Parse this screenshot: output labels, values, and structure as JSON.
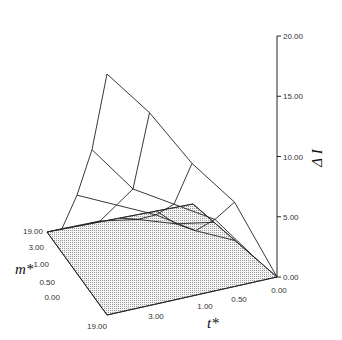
{
  "chart_data": {
    "type": "surface3d",
    "title": "",
    "zlabel": "Δ I",
    "xlabel": "t*",
    "ylabel": "m*",
    "z_ticks": [
      "0.00",
      "5.00",
      "10.00",
      "15.00",
      "20.00"
    ],
    "zlim": [
      0,
      20
    ],
    "t_ticks": [
      "19.00",
      "3.00",
      "1.00",
      "0.50",
      "0.00"
    ],
    "m_ticks": [
      "19.00",
      "3.00",
      "1.00",
      "0.50",
      "0.00"
    ],
    "t_values": [
      19,
      3,
      1,
      0.5,
      0
    ],
    "m_values": [
      19,
      3,
      1,
      0.5,
      0
    ],
    "reference_plane": {
      "z": 0,
      "fill": "dotted-gray"
    },
    "z_values_by_m_rows_t_cols": [
      [
        0.0,
        7.0,
        11.0,
        16.0,
        20.0
      ],
      [
        0.0,
        4.0,
        6.0,
        8.0,
        12.0
      ],
      [
        0.0,
        1.5,
        3.5,
        5.0,
        6.5
      ],
      [
        0.0,
        0.5,
        1.5,
        2.0,
        2.0
      ],
      [
        0.0,
        0.0,
        0.0,
        0.0,
        0.0
      ]
    ],
    "grid": true,
    "legend": "none"
  },
  "labels": {
    "z_axis_title": "Δ I",
    "t_axis_title": "t*",
    "m_axis_title": "m*"
  }
}
